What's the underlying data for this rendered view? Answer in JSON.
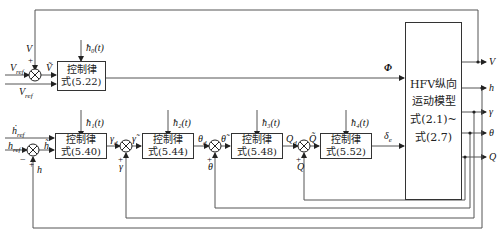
{
  "blocks": {
    "ctrl_522": {
      "line1": "控制律",
      "line2": "式(5.22)"
    },
    "ctrl_540": {
      "line1": "控制律",
      "line2": "式(5.40)"
    },
    "ctrl_544": {
      "line1": "控制律",
      "line2": "式(5.44)"
    },
    "ctrl_548": {
      "line1": "控制律",
      "line2": "式(5.48)"
    },
    "ctrl_552": {
      "line1": "控制律",
      "line2": "式(5.52)"
    },
    "plant": {
      "line1": "HFV纵向",
      "line2": "运动模型",
      "line3": "式(2.1)~",
      "line4": "式(2.7)"
    }
  },
  "signals": {
    "V": "V",
    "V_tilde": "Ṽ",
    "V_ref": "V",
    "V_ref_sub": "ref",
    "V_ref2": "V",
    "h0": "ħ₀(t)",
    "h1": "ħ₁(t)",
    "h2": "ħ₂(t)",
    "h3": "ħ₃(t)",
    "h4": "ħ₄(t)",
    "Phi": "Φ",
    "h_ref_dot": "ḣ",
    "h_ref": "h",
    "ref_sub": "ref",
    "h_tilde": "h̃",
    "h": "h",
    "gamma_d": "γ",
    "d_sub": "d",
    "gamma_tilde": "γ̃",
    "gamma": "γ",
    "theta_d": "θ",
    "theta_tilde": "θ̃",
    "theta": "θ",
    "Q_d": "Q",
    "Q_tilde": "Q̃",
    "Q": "Q",
    "delta_e": "δ",
    "e_sub": "e",
    "plus": "+",
    "minus": "−"
  },
  "outputs": [
    "V",
    "h",
    "γ",
    "θ",
    "Q"
  ]
}
